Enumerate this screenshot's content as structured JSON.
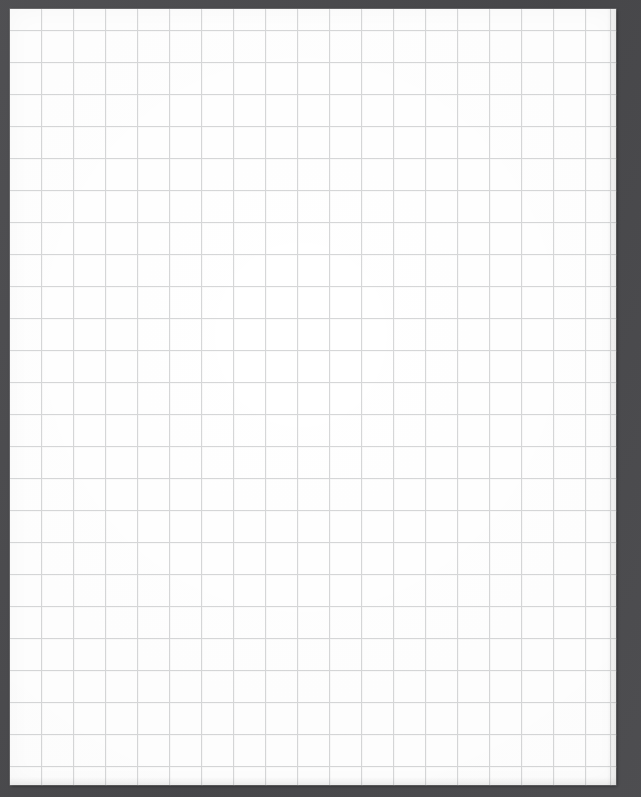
{
  "document": {
    "kind": "graph-paper-scan",
    "title": "Blank grid paper sheet",
    "content_text": "",
    "has_handwriting": false,
    "has_printed_text": false
  },
  "canvas": {
    "width_px": 641,
    "height_px": 797
  },
  "backdrop": {
    "name": "scanner-lid-background",
    "color": "#4a4a4d"
  },
  "sheet": {
    "name": "paper-sheet",
    "color": "#ffffff",
    "left_px": 10,
    "top_px": 9,
    "width_px": 606,
    "height_px": 776,
    "margin_left_px": 10,
    "margin_top_px": 9,
    "margin_right_px": 25,
    "margin_bottom_px": 12
  },
  "grid": {
    "name": "square-ruling",
    "line_color": "#d6d7d8",
    "ghost_line_color": "#e6e7e8",
    "cell_size_px": 32,
    "line_width_px": 1,
    "origin_x_px": 31,
    "origin_y_px": 21,
    "columns": 19,
    "rows": 24,
    "v_line_count": 19,
    "h_line_count": 24,
    "v_line_positions": [
      31,
      63,
      95,
      127,
      159,
      191,
      223,
      255,
      287,
      319,
      351,
      383,
      415,
      447,
      479,
      511,
      543,
      575,
      600
    ],
    "h_line_positions": [
      21,
      53,
      85,
      117,
      149,
      181,
      213,
      245,
      277,
      309,
      341,
      373,
      405,
      437,
      469,
      501,
      533,
      565,
      597,
      629,
      661,
      693,
      725,
      757
    ]
  }
}
